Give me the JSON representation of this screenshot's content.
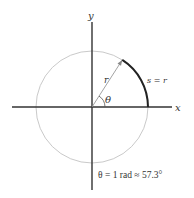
{
  "diagram": {
    "axes": {
      "x_label": "x",
      "y_label": "y"
    },
    "radius_label": "r",
    "angle_label": "θ",
    "arc_label": "s = r",
    "caption": "θ = 1 rad ≈ 57.3°",
    "colors": {
      "circle": "#bbbbbb",
      "axes": "#333333",
      "arc": "#222222",
      "radius": "#999999"
    }
  }
}
